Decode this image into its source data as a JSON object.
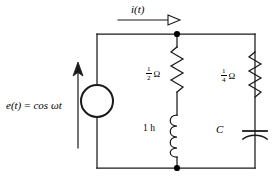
{
  "figure": {
    "name": "rlc-circuit-diagram",
    "background_color": "#ffffff",
    "line_color": "#1a1a1a"
  },
  "source": {
    "symbol": "circle-source",
    "label_fn": "e(t)",
    "equals": "=",
    "label_expr": "cos ωt",
    "polarity_arrow": "up"
  },
  "current": {
    "label": "i(t)",
    "arrow_direction": "right"
  },
  "branches": {
    "middle": {
      "resistor": {
        "name": "resistor-half-ohm",
        "numerator": "1",
        "denominator": "2",
        "unit": "Ω"
      },
      "inductor": {
        "name": "inductor-1h",
        "label": "1 h"
      }
    },
    "right": {
      "resistor": {
        "name": "resistor-quarter-ohm",
        "numerator": "1",
        "denominator": "4",
        "unit": "Ω"
      },
      "capacitor": {
        "name": "capacitor-c",
        "label": "C"
      }
    }
  },
  "nodes": {
    "top_junction": "top-node",
    "bottom_junction": "bottom-node"
  }
}
